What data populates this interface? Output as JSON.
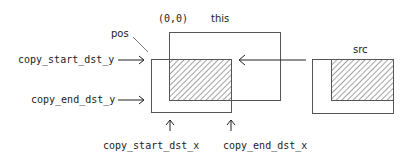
{
  "diagram": {
    "labels": {
      "origin": "(0,0)",
      "this": "this",
      "pos": "pos",
      "src": "src",
      "copy_start_dst_y": "copy_start_dst_y",
      "copy_end_dst_y": "copy_end_dst_y",
      "copy_start_dst_x": "copy_start_dst_x",
      "copy_end_dst_x": "copy_end_dst_x"
    },
    "colors": {
      "stroke": "#555555",
      "text": "#222222",
      "background": "#ffffff"
    }
  }
}
